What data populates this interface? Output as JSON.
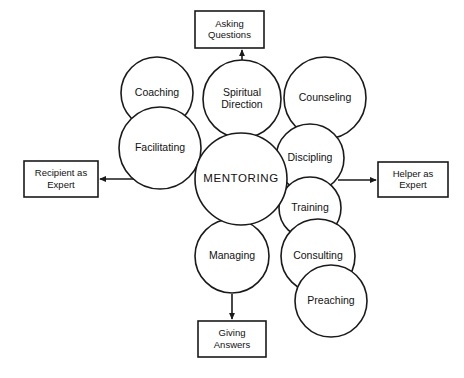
{
  "diagram": {
    "colors": {
      "stroke": "#1a1a1a",
      "fill": "#ffffff",
      "text": "#111111",
      "background": "#ffffff"
    },
    "center_node": {
      "label": "MENTORING",
      "cx": 241,
      "cy": 179,
      "r": 46
    },
    "circles": [
      {
        "id": "coaching",
        "label": "Coaching",
        "lines": [
          "Coaching"
        ],
        "cx": 157,
        "cy": 93,
        "r": 36
      },
      {
        "id": "facilitating",
        "label": "Facilitating",
        "lines": [
          "Facilitating"
        ],
        "cx": 160,
        "cy": 148,
        "r": 41
      },
      {
        "id": "spiritual-direction",
        "label": "Spiritual Direction",
        "lines": [
          "Spiritual",
          "Direction"
        ],
        "cx": 242,
        "cy": 99,
        "r": 39
      },
      {
        "id": "counseling",
        "label": "Counseling",
        "lines": [
          "Counseling"
        ],
        "cx": 325,
        "cy": 98,
        "r": 41
      },
      {
        "id": "discipling",
        "label": "Discipling",
        "lines": [
          "Discipling"
        ],
        "cx": 310,
        "cy": 158,
        "r": 34
      },
      {
        "id": "training",
        "label": "Training",
        "lines": [
          "Training"
        ],
        "cx": 310,
        "cy": 208,
        "r": 31
      },
      {
        "id": "managing",
        "label": "Managing",
        "lines": [
          "Managing"
        ],
        "cx": 232,
        "cy": 256,
        "r": 37
      },
      {
        "id": "consulting",
        "label": "Consulting",
        "lines": [
          "Consulting"
        ],
        "cx": 318,
        "cy": 256,
        "r": 37
      },
      {
        "id": "preaching",
        "label": "Preaching",
        "lines": [
          "Preaching"
        ],
        "cx": 331,
        "cy": 301,
        "r": 36
      }
    ],
    "boxes": [
      {
        "id": "asking-questions",
        "label": "Asking Questions",
        "lines": [
          "Asking",
          "Questions"
        ],
        "x": 195,
        "y": 11,
        "w": 69,
        "h": 37
      },
      {
        "id": "recipient-expert",
        "label": "Recipient as Expert",
        "lines": [
          "Recipient as",
          "Expert"
        ],
        "x": 24,
        "y": 161,
        "w": 74,
        "h": 36
      },
      {
        "id": "helper-expert",
        "label": "Helper as Expert",
        "lines": [
          "Helper as",
          "Expert"
        ],
        "x": 378,
        "y": 162,
        "w": 70,
        "h": 35
      },
      {
        "id": "giving-answers",
        "label": "Giving Answers",
        "lines": [
          "Giving",
          "Answers"
        ],
        "x": 198,
        "y": 321,
        "w": 68,
        "h": 36
      }
    ],
    "arrows": [
      {
        "id": "arrow-to-asking-questions",
        "from": "spiritual-direction",
        "to": "asking-questions",
        "direction": "up"
      },
      {
        "id": "arrow-to-recipient-expert",
        "from": "facilitating",
        "to": "recipient-expert",
        "direction": "left"
      },
      {
        "id": "arrow-to-helper-expert",
        "from": "discipling",
        "to": "helper-expert",
        "direction": "right"
      },
      {
        "id": "arrow-to-giving-answers",
        "from": "managing",
        "to": "giving-answers",
        "direction": "down"
      }
    ]
  }
}
